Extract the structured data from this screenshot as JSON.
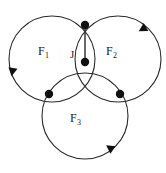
{
  "diagram": {
    "background_color": "#ffffff",
    "stroke_color": "#2a2a2a",
    "node_color": "#111111",
    "stroke_width": 1.1,
    "labels": {
      "face_1": "F",
      "face_1_sub": "1",
      "face_2": "F",
      "face_2_sub": "2",
      "face_3": "F",
      "face_3_sub": "3",
      "junction": "J"
    },
    "circles": [
      {
        "name": "F1",
        "cx": 52,
        "cy": 59,
        "r": 43,
        "label": "F1"
      },
      {
        "name": "F2",
        "cx": 118,
        "cy": 59,
        "r": 43,
        "label": "F2"
      },
      {
        "name": "F3",
        "cx": 85,
        "cy": 116,
        "r": 43,
        "label": "F3"
      }
    ],
    "nodes": [
      {
        "name": "node-top",
        "x": 85,
        "y": 25,
        "r": 4.2
      },
      {
        "name": "node-center",
        "x": 85,
        "y": 62,
        "r": 4.2
      },
      {
        "name": "node-left",
        "x": 49,
        "y": 94,
        "r": 4.2
      },
      {
        "name": "node-right",
        "x": 120,
        "y": 94,
        "r": 4.2
      }
    ],
    "connector": {
      "name": "junction-segment",
      "x1": 85,
      "y1": 25,
      "x2": 85,
      "y2": 62
    },
    "spokes": [
      {
        "name": "spoke-left",
        "x1": 85,
        "y1": 62,
        "x2": 49,
        "y2": 94
      },
      {
        "name": "spoke-right",
        "x1": 85,
        "y1": 62,
        "x2": 120,
        "y2": 94
      }
    ],
    "arrows": [
      {
        "name": "arrow-f1",
        "on_circle": "F1",
        "x": 13,
        "y": 68,
        "angle": 100,
        "direction": "down"
      },
      {
        "name": "arrow-f2",
        "on_circle": "F2",
        "x": 146,
        "y": 27,
        "angle": 150,
        "direction": "down-right"
      },
      {
        "name": "arrow-f3",
        "on_circle": "F3",
        "x": 113,
        "y": 150,
        "angle": 215,
        "direction": "left-down"
      }
    ]
  }
}
